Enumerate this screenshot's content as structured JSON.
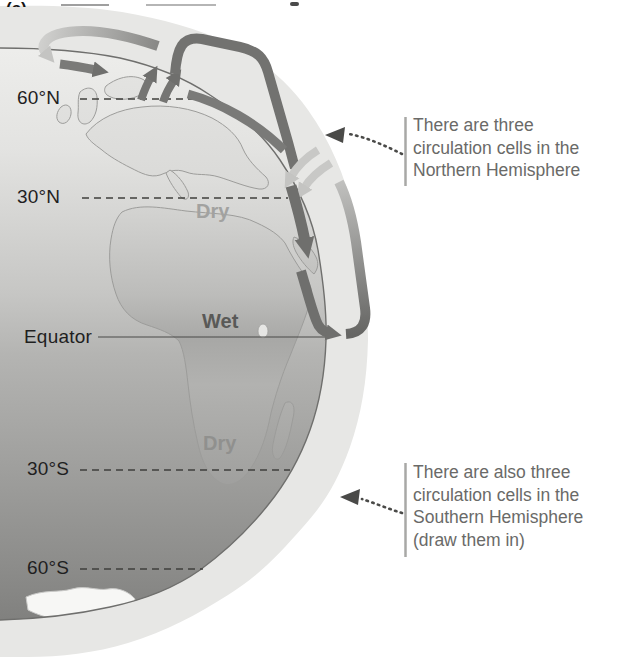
{
  "figure": {
    "cropped_caption": "(a)",
    "latitude_labels": [
      {
        "text": "60°N"
      },
      {
        "text": "30°N"
      },
      {
        "text": "Equator"
      },
      {
        "text": "30°S"
      },
      {
        "text": "60°S"
      }
    ],
    "climate_labels": [
      {
        "text": "Dry",
        "zone": "northern-subtropics"
      },
      {
        "text": "Wet",
        "zone": "equator"
      },
      {
        "text": "Dry",
        "zone": "southern-subtropics"
      }
    ],
    "annotations": [
      {
        "side": "north",
        "lines": [
          "There are three",
          "circulation cells in the",
          "Northern Hemisphere"
        ]
      },
      {
        "side": "south",
        "lines": [
          "There are also three",
          "circulation cells in the",
          "Southern Hemisphere",
          "(draw them in)"
        ]
      }
    ],
    "colors": {
      "page_background": "#ffffff",
      "atmosphere_ring": "#e7e7e5",
      "globe_light": "#eeeeec",
      "globe_dark": "#7b7b79",
      "arrow_dark": "#6f6f6d",
      "arrow_light": "#c8c8c6",
      "latitude_label": "#1f1f1f",
      "dry_label": "#a2a2a0",
      "wet_label": "#595957",
      "annotation_text": "#6a6a68"
    }
  }
}
